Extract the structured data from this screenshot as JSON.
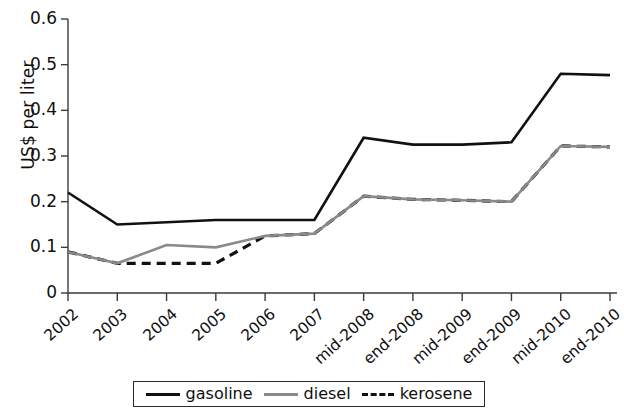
{
  "chart_data": {
    "type": "line",
    "title": "",
    "xlabel": "",
    "ylabel": "US$ per liter",
    "ylim": [
      0,
      0.6
    ],
    "ytick_labels": [
      "0",
      "0.1",
      "0.2",
      "0.3",
      "0.4",
      "0.5",
      "0.6"
    ],
    "ytick_values": [
      0,
      0.1,
      0.2,
      0.3,
      0.4,
      0.5,
      0.6
    ],
    "grid": false,
    "legend_position": "bottom",
    "categories": [
      "2002",
      "2003",
      "2004",
      "2005",
      "2006",
      "2007",
      "mid-2008",
      "end-2008",
      "mid-2009",
      "end-2009",
      "mid-2010",
      "end-2010"
    ],
    "series": [
      {
        "name": "gasoline",
        "color": "#111111",
        "style": "solid",
        "values": [
          0.22,
          0.15,
          0.155,
          0.16,
          0.16,
          0.16,
          0.34,
          0.325,
          0.325,
          0.33,
          0.48,
          0.477
        ]
      },
      {
        "name": "diesel",
        "color": "#8a8a8a",
        "style": "solid",
        "values": [
          0.09,
          0.065,
          0.105,
          0.1,
          0.125,
          0.13,
          0.212,
          0.205,
          0.203,
          0.2,
          0.322,
          0.32
        ]
      },
      {
        "name": "kerosene",
        "color": "#111111",
        "style": "dashed",
        "values": [
          0.09,
          0.065,
          0.065,
          0.065,
          0.125,
          0.13,
          0.212,
          0.205,
          0.203,
          0.2,
          0.322,
          0.32
        ]
      }
    ]
  },
  "axes": {
    "y_label": "US$ per liter",
    "y_ticks": [
      "0.6",
      "0.5",
      "0.4",
      "0.3",
      "0.2",
      "0.1",
      "0"
    ],
    "x_ticks": [
      "2002",
      "2003",
      "2004",
      "2005",
      "2006",
      "2007",
      "mid-2008",
      "end-2008",
      "mid-2009",
      "end-2009",
      "mid-2010",
      "end-2010"
    ]
  },
  "legend": {
    "items": [
      {
        "label": "gasoline",
        "color": "#111111",
        "style": "solid"
      },
      {
        "label": "diesel",
        "color": "#8a8a8a",
        "style": "solid"
      },
      {
        "label": "kerosene",
        "color": "#111111",
        "style": "dashed"
      }
    ]
  }
}
